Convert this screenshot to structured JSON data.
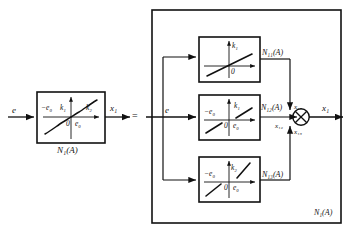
{
  "figure": {
    "type": "block-diagram",
    "equals_sign": "=",
    "outer_block_label": "N₁(A)"
  },
  "left_side": {
    "input_label": "e",
    "output_label": "x₁",
    "block_caption": "N₁(A)",
    "graph": {
      "origin_label": "0",
      "left_breakpoint": "−e₀",
      "right_breakpoint": "e₀",
      "inner_slope": "k₁",
      "outer_slope": "k₂",
      "shape": "odd-symmetric piecewise curve: gentle slope k2 outside, steep slope k1 near origin"
    }
  },
  "right_side": {
    "input_label": "e",
    "output_label": "x₁",
    "sum_junction": {
      "name": "summing-junction",
      "symbol": "crossed-circle",
      "inputs": [
        "x₁₁",
        "x₁₂",
        "x₁₃"
      ],
      "output": "x₁"
    },
    "branches": [
      {
        "id": "top",
        "block_label": "N₁₁(A)",
        "signal_label": "x₁₁",
        "graph": {
          "origin_label": "0",
          "slope_label": "k₁",
          "left_breakpoint": "",
          "right_breakpoint": "",
          "shape": "linear through origin with slope k1"
        }
      },
      {
        "id": "middle",
        "block_label": "N₁₂(A)",
        "signal_label": "x₁₂",
        "graph": {
          "origin_label": "0",
          "slope_label": "k₁",
          "left_breakpoint": "−e₀",
          "right_breakpoint": "e₀",
          "shape": "dead-zone characteristic with slope k1 outside ±e0"
        }
      },
      {
        "id": "bottom",
        "block_label": "N₁₃(A)",
        "signal_label": "x₁₃",
        "graph": {
          "origin_label": "0",
          "slope_label": "k₂",
          "left_breakpoint": "−e₀",
          "right_breakpoint": "e₀",
          "shape": "dead-zone characteristic with slope k2 outside ±e0"
        }
      }
    ]
  },
  "colors": {
    "line": "#111111",
    "background": "#ffffff",
    "text": "#111111"
  }
}
